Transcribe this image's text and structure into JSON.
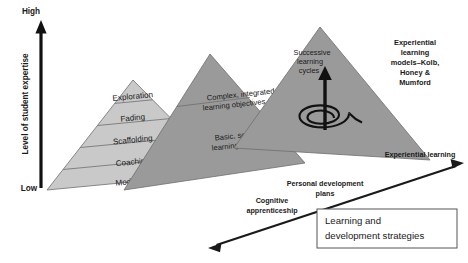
{
  "figure": {
    "colors": {
      "pyramid_light": "#c9c9c9",
      "pyramid_mid": "#9a9a9a",
      "pyramid_right": "#9a9a9a",
      "outline": "#6e6e6e",
      "text": "#1a1a1a",
      "arrow": "#111111",
      "box_border": "#555555",
      "background": "#ffffff"
    }
  },
  "axis": {
    "name": "vertical-axis",
    "title": "Level of student expertise",
    "high_label": "High",
    "low_label": "Low",
    "icon": "up-arrow-icon"
  },
  "pyramids": [
    {
      "id": "cognitive-apprenticeship",
      "caption": "Cognitive apprenticeship",
      "caption_lines": [
        "Cognitive",
        "apprenticeship"
      ],
      "tiers": [
        {
          "label": "Exploration"
        },
        {
          "label": "Fading"
        },
        {
          "label": "Scaffolding"
        },
        {
          "label": "Coaching"
        },
        {
          "label": "Modelling"
        }
      ]
    },
    {
      "id": "personal-development-plans",
      "caption": "Personal development plans",
      "caption_lines": [
        "Personal development",
        "plans"
      ],
      "tiers": [
        {
          "label_lines": [
            "Complex, integrated",
            "learning objectives"
          ]
        },
        {
          "label_lines": [
            "Basic, separate",
            "learning objectives"
          ]
        }
      ]
    },
    {
      "id": "experiential-learning",
      "caption": "Experiential learning",
      "caption_lines": [
        "Experiential learning"
      ],
      "annotation_cycles": [
        "Successive",
        "learning",
        "cycles"
      ],
      "annotation_models": [
        "Experiential",
        "learning",
        "models–Kolb,",
        "Honey &",
        "Mumford"
      ],
      "icons": [
        "spiral-icon",
        "up-arrow-icon"
      ]
    }
  ],
  "callout_box": {
    "name": "learning-and-development-strategies-box",
    "lines": [
      "Learning and",
      "development strategies"
    ],
    "text": "Learning and development strategies"
  },
  "connector": {
    "name": "double-headed-arrow",
    "icon": "double-arrow-icon"
  }
}
